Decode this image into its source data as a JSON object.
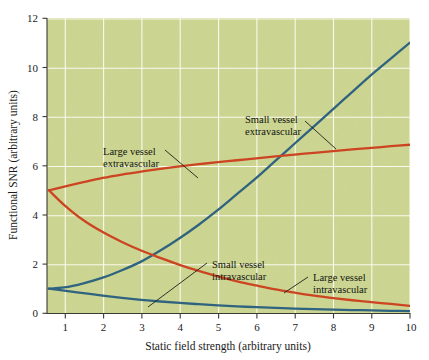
{
  "chart_data": {
    "type": "line",
    "title": "",
    "xlabel": "Static field strength (arbitrary units)",
    "ylabel": "Functional SNR (arbitrary units)",
    "xlim": [
      0.55,
      10
    ],
    "ylim": [
      0,
      12
    ],
    "xticks": [
      1,
      2,
      3,
      4,
      5,
      6,
      7,
      8,
      9,
      10
    ],
    "yticks": [
      0,
      2,
      4,
      6,
      8,
      10,
      12
    ],
    "grid": true,
    "legend": "none (inline annotations with leader lines)",
    "plot_background": "#ccd68f",
    "gridline_color": "#fdfdf4",
    "x": [
      0.6,
      1,
      1.5,
      2,
      2.5,
      3,
      3.5,
      4,
      4.5,
      5,
      5.5,
      6,
      6.5,
      7,
      7.5,
      8,
      8.5,
      9,
      9.5,
      10
    ],
    "series": [
      {
        "name": "Small vessel extravascular",
        "color": "#2f637f",
        "values": [
          1.0,
          1.05,
          1.22,
          1.45,
          1.75,
          2.1,
          2.55,
          3.05,
          3.6,
          4.2,
          4.85,
          5.5,
          6.2,
          6.9,
          7.6,
          8.3,
          9.0,
          9.7,
          10.35,
          11.0
        ]
      },
      {
        "name": "Large vessel extravascular",
        "color": "#cc4422",
        "values": [
          5.0,
          5.15,
          5.33,
          5.5,
          5.64,
          5.76,
          5.87,
          5.97,
          6.06,
          6.14,
          6.22,
          6.3,
          6.38,
          6.45,
          6.52,
          6.59,
          6.66,
          6.72,
          6.79,
          6.85
        ]
      },
      {
        "name": "Large vessel intravascular",
        "color": "#cc4422",
        "values": [
          5.0,
          4.4,
          3.78,
          3.3,
          2.9,
          2.55,
          2.25,
          1.97,
          1.72,
          1.5,
          1.3,
          1.13,
          0.97,
          0.84,
          0.72,
          0.62,
          0.53,
          0.45,
          0.38,
          0.3
        ]
      },
      {
        "name": "Small vessel intravascular",
        "color": "#2f637f",
        "values": [
          1.0,
          0.92,
          0.82,
          0.72,
          0.63,
          0.55,
          0.48,
          0.42,
          0.37,
          0.32,
          0.28,
          0.25,
          0.22,
          0.19,
          0.17,
          0.15,
          0.13,
          0.12,
          0.1,
          0.09
        ]
      }
    ],
    "annotations": [
      {
        "id": "large-vessel-extravascular",
        "line1": "Large vessel",
        "line2": "extravascular",
        "text_x": 103,
        "text_y": 155,
        "leader": "M 165 150 L 198 178"
      },
      {
        "id": "small-vessel-extravascular",
        "line1": "Small vessel",
        "line2": "extravascular",
        "text_x": 245,
        "text_y": 123,
        "leader": "M 305 121 L 334 146"
      },
      {
        "id": "small-vessel-intravascular",
        "line1": "Small vessel",
        "line2": "intravascular",
        "text_x": 212,
        "text_y": 268,
        "leader": "M 208 264 L 148 308"
      },
      {
        "id": "large-vessel-intravascular",
        "line1": "Large vessel",
        "line2": "intravascular",
        "text_x": 313,
        "text_y": 281,
        "leader": "M 308 278 L 284 294"
      }
    ]
  },
  "axis": {
    "xtick_labels": [
      "1",
      "2",
      "3",
      "4",
      "5",
      "6",
      "7",
      "8",
      "9",
      "10"
    ],
    "ytick_labels": [
      "0",
      "2",
      "4",
      "6",
      "8",
      "10",
      "12"
    ]
  }
}
